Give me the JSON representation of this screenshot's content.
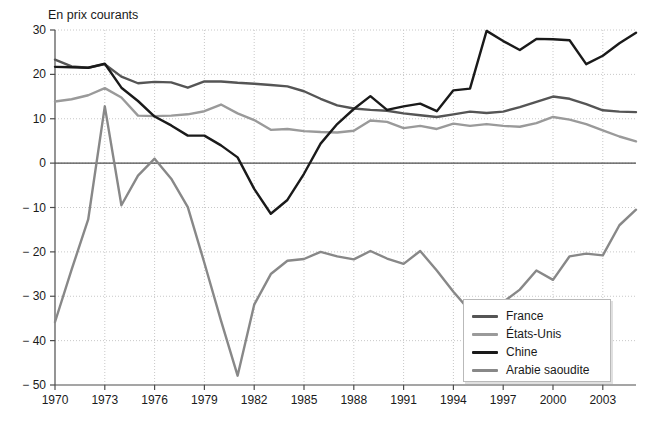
{
  "chart_data": {
    "type": "line",
    "title": "En prix courants",
    "xlabel": "",
    "ylabel": "",
    "xlim": [
      1970,
      2005
    ],
    "ylim": [
      -50,
      30
    ],
    "ytick_step": 10,
    "xtick_step": 3,
    "grid": true,
    "legend_position": "bottom-right",
    "yticks": [
      "30",
      "20",
      "10",
      "0",
      "− 10",
      "− 20",
      "− 30",
      "− 40",
      "− 50"
    ],
    "ytick_values": [
      30,
      20,
      10,
      0,
      -10,
      -20,
      -30,
      -40,
      -50
    ],
    "xticks": [
      "1970",
      "1973",
      "1976",
      "1979",
      "1982",
      "1985",
      "1988",
      "1991",
      "1994",
      "1997",
      "2000",
      "2003"
    ],
    "xtick_values": [
      1970,
      1973,
      1976,
      1979,
      1982,
      1985,
      1988,
      1991,
      1994,
      1997,
      2000,
      2003
    ],
    "x": [
      1970,
      1971,
      1972,
      1973,
      1974,
      1975,
      1976,
      1977,
      1978,
      1979,
      1980,
      1981,
      1982,
      1983,
      1984,
      1985,
      1986,
      1987,
      1988,
      1989,
      1990,
      1991,
      1992,
      1993,
      1994,
      1995,
      1996,
      1997,
      1998,
      1999,
      2000,
      2001,
      2002,
      2003,
      2004,
      2005
    ],
    "series": [
      {
        "name": "France",
        "color": "#555555",
        "values": [
          23.3,
          21.8,
          21.5,
          22.3,
          19.5,
          18.0,
          18.3,
          18.2,
          17.0,
          18.4,
          18.4,
          18.1,
          17.9,
          17.6,
          17.3,
          16.2,
          14.5,
          13.0,
          12.3,
          12.0,
          11.8,
          11.2,
          10.8,
          10.4,
          11.0,
          11.6,
          11.3,
          11.6,
          12.6,
          13.8,
          15.0,
          14.5,
          13.3,
          11.9,
          11.6,
          11.5
        ]
      },
      {
        "name": "États-Unis",
        "color": "#9a9a9a",
        "values": [
          13.9,
          14.4,
          15.3,
          16.9,
          14.8,
          10.7,
          10.6,
          10.7,
          11.0,
          11.7,
          13.2,
          11.2,
          9.7,
          7.5,
          7.7,
          7.2,
          7.0,
          6.9,
          7.3,
          9.6,
          9.3,
          7.9,
          8.4,
          7.7,
          8.9,
          8.4,
          8.8,
          8.4,
          8.2,
          9.0,
          10.4,
          9.8,
          8.8,
          7.4,
          6.0,
          4.9
        ]
      },
      {
        "name": "Chine",
        "color": "#1a1a1a",
        "values": [
          21.7,
          21.6,
          21.5,
          22.4,
          17.0,
          14.0,
          10.5,
          8.5,
          6.2,
          6.2,
          4.0,
          1.3,
          -5.8,
          -11.4,
          -8.3,
          -2.4,
          4.4,
          8.8,
          12.2,
          15.1,
          12.0,
          12.8,
          13.4,
          11.7,
          16.4,
          16.8,
          29.8,
          27.5,
          25.5,
          28.0,
          27.9,
          27.7,
          22.3,
          24.2,
          27.0,
          29.4
        ]
      },
      {
        "name": "Arabie saoudite",
        "color": "#888888",
        "values": [
          -35.8,
          -24.0,
          -12.7,
          12.8,
          -9.5,
          -2.8,
          1.0,
          -3.5,
          -9.9,
          -22.5,
          -35.5,
          -47.9,
          -31.9,
          -25.0,
          -22.0,
          -21.6,
          -20.0,
          -21.0,
          -21.7,
          -19.8,
          -21.5,
          -22.7,
          -19.8,
          -24.2,
          -29.0,
          -33.3,
          -36.4,
          -31.3,
          -28.5,
          -24.2,
          -26.3,
          -21.0,
          -20.4,
          -20.8,
          -14.0,
          -10.5
        ]
      }
    ]
  },
  "legend": {
    "items": [
      {
        "label": "France",
        "color": "#555555"
      },
      {
        "label": "États-Unis",
        "color": "#9a9a9a"
      },
      {
        "label": "Chine",
        "color": "#1a1a1a"
      },
      {
        "label": "Arabie saoudite",
        "color": "#888888"
      }
    ]
  },
  "axes": {
    "zero_line_color": "#4d4d4d",
    "grid_color": "#c8c8c8",
    "tick_color": "#4d4d4d"
  }
}
